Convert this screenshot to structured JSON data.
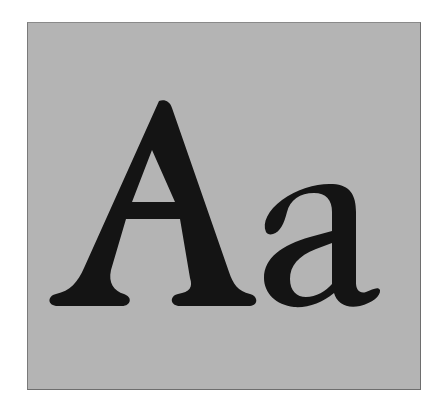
{
  "specimen": {
    "text": "Aa",
    "uppercase": "A",
    "lowercase": "a",
    "style": "serif"
  },
  "colors": {
    "page_background": "#ffffff",
    "box_background": "#b4b4b4",
    "box_border": "#6e6e6e",
    "glyph_fill": "#141414"
  }
}
